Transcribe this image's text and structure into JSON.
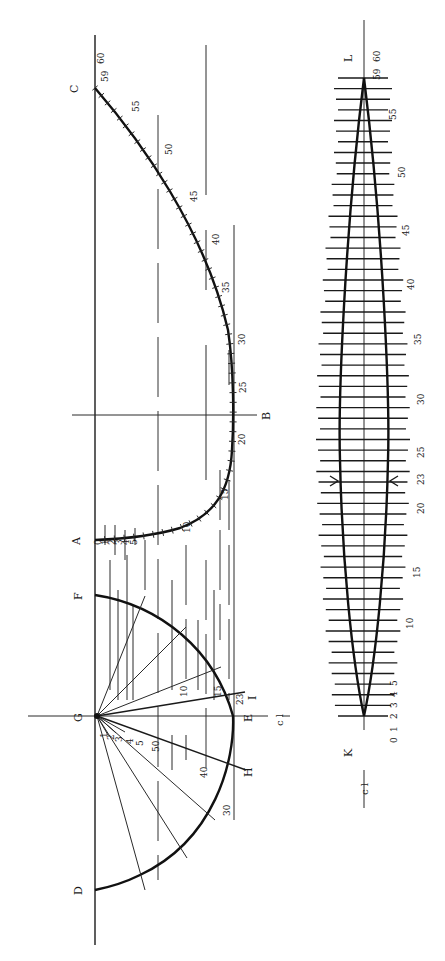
{
  "figure": {
    "stroke_color": "#111111",
    "background": "#ffffff"
  },
  "profile": {
    "labels": {
      "A": "A",
      "B": "B",
      "C": "C"
    },
    "station_labels": [
      {
        "text": "0",
        "x": 101,
        "y": 545
      },
      {
        "text": "1",
        "x": 108,
        "y": 545
      },
      {
        "text": "2",
        "x": 115,
        "y": 545
      },
      {
        "text": "3",
        "x": 122,
        "y": 545
      },
      {
        "text": "4",
        "x": 129,
        "y": 545
      },
      {
        "text": "5",
        "x": 137,
        "y": 545
      },
      {
        "text": "10",
        "x": 190,
        "y": 533
      },
      {
        "text": "15",
        "x": 228,
        "y": 500
      },
      {
        "text": "20",
        "x": 245,
        "y": 445
      },
      {
        "text": "25",
        "x": 246,
        "y": 393
      },
      {
        "text": "30",
        "x": 245,
        "y": 345
      },
      {
        "text": "35",
        "x": 229,
        "y": 293
      },
      {
        "text": "40",
        "x": 219,
        "y": 245
      },
      {
        "text": "45",
        "x": 197,
        "y": 202
      },
      {
        "text": "50",
        "x": 172,
        "y": 155
      },
      {
        "text": "55",
        "x": 139,
        "y": 112
      },
      {
        "text": "59",
        "x": 108,
        "y": 82
      },
      {
        "text": "60",
        "x": 104,
        "y": 64
      }
    ]
  },
  "section": {
    "labels": {
      "G": "G",
      "F": "F",
      "E": "E",
      "D": "D",
      "H": "H",
      "I": "I",
      "cl": "c l"
    },
    "station_labels": [
      {
        "text": "1",
        "x": 107,
        "y": 738
      },
      {
        "text": "2",
        "x": 114,
        "y": 740
      },
      {
        "text": "3",
        "x": 122,
        "y": 742
      },
      {
        "text": "4",
        "x": 133,
        "y": 744
      },
      {
        "text": "5",
        "x": 143,
        "y": 746
      },
      {
        "text": "50",
        "x": 159,
        "y": 752
      },
      {
        "text": "10",
        "x": 187,
        "y": 697
      },
      {
        "text": "15",
        "x": 221,
        "y": 697
      },
      {
        "text": "23",
        "x": 243,
        "y": 705
      },
      {
        "text": "40",
        "x": 207,
        "y": 778
      },
      {
        "text": "30",
        "x": 230,
        "y": 816
      }
    ]
  },
  "plank": {
    "labels": {
      "K": "K",
      "L": "L",
      "cl": "c l"
    },
    "station_labels": [
      {
        "text": "0",
        "x": 397,
        "y": 743
      },
      {
        "text": "1",
        "x": 397,
        "y": 732
      },
      {
        "text": "2",
        "x": 397,
        "y": 719
      },
      {
        "text": "3",
        "x": 397,
        "y": 708
      },
      {
        "text": "4",
        "x": 397,
        "y": 697
      },
      {
        "text": "5",
        "x": 397,
        "y": 686
      },
      {
        "text": "10",
        "x": 413,
        "y": 629
      },
      {
        "text": "15",
        "x": 420,
        "y": 578
      },
      {
        "text": "20",
        "x": 424,
        "y": 514
      },
      {
        "text": "23",
        "x": 424,
        "y": 485
      },
      {
        "text": "25",
        "x": 424,
        "y": 458
      },
      {
        "text": "30",
        "x": 424,
        "y": 405
      },
      {
        "text": "35",
        "x": 421,
        "y": 345
      },
      {
        "text": "40",
        "x": 414,
        "y": 290
      },
      {
        "text": "45",
        "x": 409,
        "y": 236
      },
      {
        "text": "50",
        "x": 405,
        "y": 178
      },
      {
        "text": "55",
        "x": 396,
        "y": 120
      },
      {
        "text": "59",
        "x": 380,
        "y": 80
      },
      {
        "text": "60",
        "x": 380,
        "y": 62
      }
    ]
  }
}
